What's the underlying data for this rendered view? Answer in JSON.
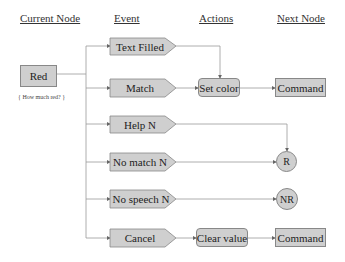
{
  "headers": {
    "current_node": "Current Node",
    "event": "Event",
    "actions": "Actions",
    "next_node": "Next Node"
  },
  "current_node": {
    "label": "Red",
    "prompt": "{ How much red? }"
  },
  "events": [
    {
      "label": "Text Filled",
      "y": 46
    },
    {
      "label": "Match",
      "y": 88
    },
    {
      "label": "Help N",
      "y": 124
    },
    {
      "label": "No match N",
      "y": 162
    },
    {
      "label": "No speech N",
      "y": 199
    },
    {
      "label": "Cancel",
      "y": 238
    }
  ],
  "actions": [
    {
      "label": "Set color"
    },
    {
      "label": "Clear value"
    }
  ],
  "next_nodes": [
    {
      "label": "Command"
    },
    {
      "label": "R"
    },
    {
      "label": "NR"
    },
    {
      "label": "Command"
    }
  ],
  "colors": {
    "node_fill": "#cfcfcf",
    "stroke": "#888888",
    "line": "#999999"
  }
}
